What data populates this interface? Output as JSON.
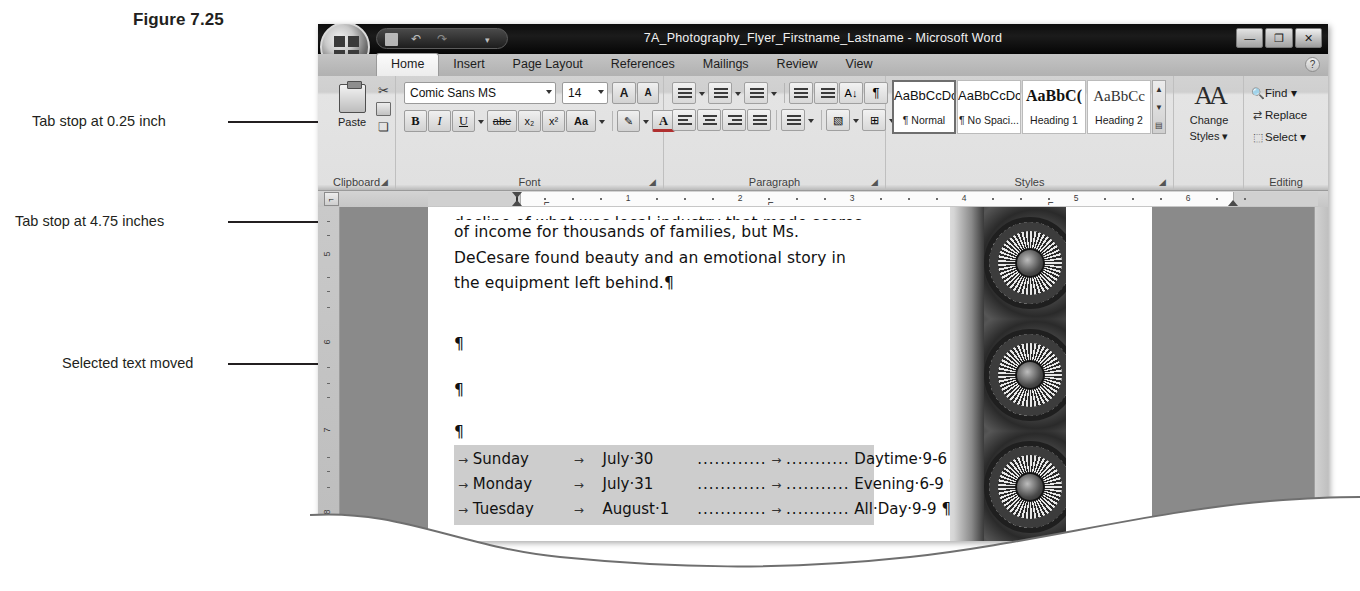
{
  "figure": {
    "caption": "Figure 7.25"
  },
  "annotations": [
    {
      "label": "Tab stop at 0.25 inch"
    },
    {
      "label": "Tab stop at 4.75 inches"
    },
    {
      "label": "Selected text moved"
    }
  ],
  "window": {
    "title": "7A_Photography_Flyer_Firstname_Lastname - Microsoft Word",
    "quick_access": {
      "save_icon": "save-icon",
      "undo_icon": "undo-icon",
      "redo_icon": "redo-icon",
      "customize_icon": "chevron-down-icon"
    },
    "office_button": "office-orb-button",
    "controls": {
      "minimize": "—",
      "restore": "❐",
      "close": "✕"
    }
  },
  "ribbon": {
    "tabs": [
      {
        "label": "Home",
        "active": true
      },
      {
        "label": "Insert",
        "active": false
      },
      {
        "label": "Page Layout",
        "active": false
      },
      {
        "label": "References",
        "active": false
      },
      {
        "label": "Mailings",
        "active": false
      },
      {
        "label": "Review",
        "active": false
      },
      {
        "label": "View",
        "active": false
      }
    ],
    "help_icon": "?",
    "groups": {
      "clipboard": {
        "label": "Clipboard",
        "paste_label": "Paste",
        "cut_icon": "scissors-icon",
        "copy_icon": "copy-icon",
        "format_painter_icon": "format-painter-icon",
        "launcher": "◢"
      },
      "font": {
        "label": "Font",
        "font_name": "Comic Sans MS",
        "font_size": "14",
        "grow_font": "A",
        "shrink_font": "A",
        "clear_formatting_icon": "clear-formatting-icon",
        "bold": "B",
        "italic": "I",
        "underline": "U",
        "strikethrough": "abe",
        "subscript": "x₂",
        "superscript": "x²",
        "change_case": "Aa",
        "highlight_icon": "highlight-icon",
        "font_color": "A",
        "launcher": "◢"
      },
      "paragraph": {
        "label": "Paragraph",
        "bullets_icon": "bullets-icon",
        "numbering_icon": "numbering-icon",
        "multilevel_icon": "multilevel-list-icon",
        "decrease_indent_icon": "decrease-indent-icon",
        "increase_indent_icon": "increase-indent-icon",
        "sort_icon": "sort-icon",
        "show_marks_icon": "¶",
        "align_left_icon": "align-left-icon",
        "align_center_icon": "align-center-icon",
        "align_right_icon": "align-right-icon",
        "justify_icon": "justify-icon",
        "line_spacing_icon": "line-spacing-icon",
        "shading_icon": "shading-icon",
        "borders_icon": "borders-icon",
        "launcher": "◢"
      },
      "styles": {
        "label": "Styles",
        "items": [
          {
            "preview": "AaBbCcDc",
            "name": "¶ Normal",
            "selected": true
          },
          {
            "preview": "AaBbCcDc",
            "name": "¶ No Spaci...",
            "selected": false
          },
          {
            "preview": "AaBbC(",
            "name": "Heading 1",
            "selected": false
          },
          {
            "preview": "AaBbCc",
            "name": "Heading 2",
            "selected": false
          }
        ],
        "scroll_up": "▲",
        "scroll_down": "▼",
        "more": "▤",
        "launcher": "◢"
      },
      "change_styles": {
        "label": "Change\nStyles ▾",
        "line1": "Change",
        "line2": "Styles ▾",
        "icon": "change-styles-icon"
      },
      "editing": {
        "label": "Editing",
        "items": [
          {
            "icon": "find-icon",
            "label": "Find ▾"
          },
          {
            "icon": "replace-icon",
            "label": "Replace"
          },
          {
            "icon": "select-icon",
            "label": "Select ▾"
          }
        ]
      }
    }
  },
  "ruler": {
    "tab_selector_icon": "left-tab-stop-icon",
    "numbers": [
      "1",
      "2",
      "3",
      "4",
      "5",
      "6"
    ],
    "tab_stops": [
      "0.25",
      "2.25",
      "4.75"
    ],
    "units": "inches"
  },
  "document": {
    "vertical_ruler_marks": [
      "5",
      "6",
      "7",
      "8"
    ],
    "body_lines": [
      "decline of what was local industry that made scores",
      "of income for thousands of families, but Ms.",
      "DeCesare found beauty and an emotional story in",
      "the equipment left behind.¶"
    ],
    "empty_paragraphs": [
      "¶",
      "¶",
      "¶"
    ],
    "schedule": {
      "rows": [
        {
          "tab1": "→",
          "day": "Sunday",
          "tab2": "→",
          "date": "July·30",
          "leader": "............",
          "tabmark": "→",
          "leader2": "...........",
          "time": "Daytime·9-6",
          "mark": "¶"
        },
        {
          "tab1": "→",
          "day": "Monday",
          "tab2": "→",
          "date": "July·31",
          "leader": "............",
          "tabmark": "→",
          "leader2": "...........",
          "time": "Evening·6-9",
          "mark": "¶"
        },
        {
          "tab1": "→",
          "day": "Tuesday",
          "tab2": "→",
          "date": "August·1",
          "leader": "............",
          "tabmark": "→",
          "leader2": "...........",
          "time": "All·Day·9-9",
          "mark": "¶"
        }
      ]
    },
    "photo_strip_alt": "industrial-machinery-wheel-photos"
  },
  "colors": {
    "title_bar": "#0d0d0d",
    "ribbon": "#e0e0e0",
    "page": "#ffffff",
    "canvas_gray": "#8a8a8a",
    "selection_gray": "#cdcdcd",
    "text": "#111111"
  }
}
